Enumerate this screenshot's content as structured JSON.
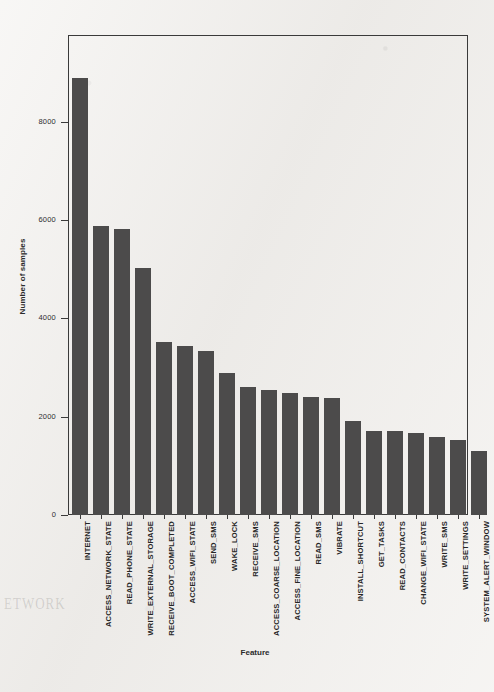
{
  "chart_data": {
    "type": "bar",
    "title": "",
    "xlabel": "Feature",
    "ylabel": "Number of samples",
    "categories": [
      "INTERNET",
      "ACCESS_NETWORK_STATE",
      "READ_PHONE_STATE",
      "WRITE_EXTERNAL_STORAGE",
      "RECEIVE_BOOT_COMPLETED",
      "ACCESS_WIFI_STATE",
      "SEND_SMS",
      "WAKE_LOCK",
      "RECEIVE_SMS",
      "ACCESS_COARSE_LOCATION",
      "ACCESS_FINE_LOCATION",
      "READ_SMS",
      "VIBRATE",
      "INSTALL_SHORTCUT",
      "GET_TASKS",
      "READ_CONTACTS",
      "CHANGE_WIFI_STATE",
      "WRITE_SMS",
      "WRITE_SETTINGS",
      "SYSTEM_ALERT_WINDOW"
    ],
    "values": [
      8900,
      5880,
      5820,
      5020,
      3520,
      3440,
      3330,
      2900,
      2600,
      2540,
      2480,
      2400,
      2380,
      1920,
      1720,
      1700,
      1660,
      1580,
      1520,
      1310
    ],
    "ylim": [
      0,
      9750
    ],
    "yticks": [
      0,
      2000,
      4000,
      6000,
      8000
    ],
    "ytick_labels": [
      "0",
      "2000",
      "4000",
      "6000",
      "8000"
    ],
    "grid": false,
    "legend": null,
    "bar_color": "#4c4b4b",
    "frame_color": "#3a3a3a",
    "background_color": "#f1efec"
  },
  "scan_artifacts": {
    "ghost_line_1": "ETWORK",
    "ghost_line_2": ""
  }
}
